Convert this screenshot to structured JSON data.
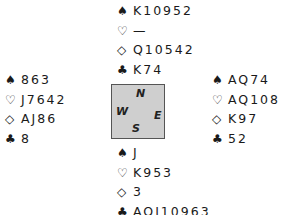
{
  "suits": {
    "spades": "♠",
    "hearts": "♡",
    "diamonds": "◇",
    "clubs": "♣"
  },
  "hands": {
    "north": {
      "spades": "K10952",
      "hearts": "—",
      "diamonds": "Q10542",
      "clubs": "K74"
    },
    "west": {
      "spades": "863",
      "hearts": "J7642",
      "diamonds": "AJ86",
      "clubs": "8"
    },
    "east": {
      "spades": "AQ74",
      "hearts": "AQ108",
      "diamonds": "K97",
      "clubs": "52"
    },
    "south": {
      "spades": "J",
      "hearts": "K953",
      "diamonds": "3",
      "clubs": "AQJ10963"
    }
  },
  "compass": {
    "north": "N",
    "west": "W",
    "east": "E",
    "south": "S"
  }
}
